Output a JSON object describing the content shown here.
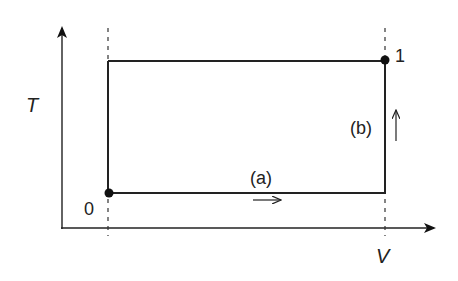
{
  "diagram": {
    "type": "thermodynamic-process-TV",
    "axes": {
      "x_label": "V",
      "y_label": "T"
    },
    "points": [
      {
        "label": "0",
        "x": 108,
        "y": 193
      },
      {
        "label": "1",
        "x": 385,
        "y": 60
      }
    ],
    "paths": [
      {
        "label": "(a)",
        "direction": "right",
        "description": "isothermal expansion at low T from point 0"
      },
      {
        "label": "(b)",
        "direction": "up",
        "description": "isochoric heating to point 1"
      }
    ],
    "colors": {
      "line": "#222222",
      "dashed": "#333333",
      "background": "#ffffff"
    }
  }
}
